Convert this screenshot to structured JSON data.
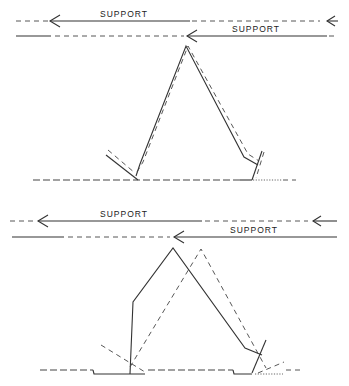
{
  "figure": {
    "panels": [
      {
        "name": "top-panel",
        "support_labels": [
          "SUPPORT",
          "SUPPORT"
        ],
        "description": "Gait stick-figure comparison with overlapping solid and dashed limb outlines"
      },
      {
        "name": "bottom-panel",
        "support_labels": [
          "SUPPORT",
          "SUPPORT"
        ],
        "description": "Gait stick-figure comparison with offset solid and dashed limb outlines"
      }
    ]
  }
}
